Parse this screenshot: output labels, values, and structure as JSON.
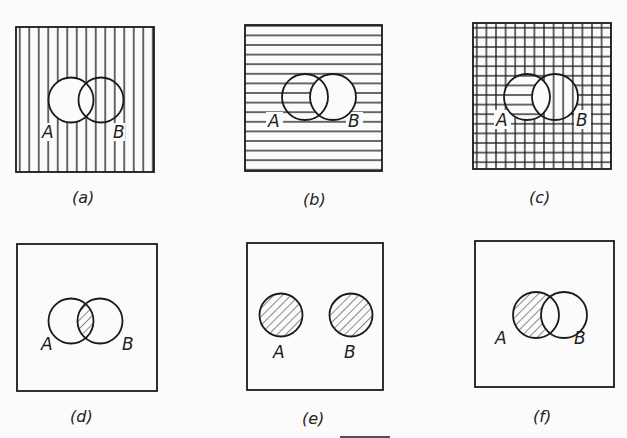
{
  "figure": {
    "stroke_color": "#1a1a1a",
    "background": "#fbfbfb",
    "panels": [
      {
        "id": "a",
        "caption": "(a)",
        "shading": "vertical lines over universe except interior of A",
        "set_labels": {
          "a": "A",
          "b": "B"
        }
      },
      {
        "id": "b",
        "caption": "(b)",
        "shading": "horizontal lines over universe except interior of B",
        "set_labels": {
          "a": "A",
          "b": "B"
        }
      },
      {
        "id": "c",
        "caption": "(c)",
        "shading": "grid (a and b overlaid); A-only horizontal, B-only vertical, A∩B blank",
        "set_labels": {
          "a": "A",
          "b": "B"
        }
      },
      {
        "id": "d",
        "caption": "(d)",
        "shading": "diagonal hatch on A∩B",
        "set_labels": {
          "a": "A",
          "b": "B"
        }
      },
      {
        "id": "e",
        "caption": "(e)",
        "shading": "diagonal hatch on disjoint A and B",
        "set_labels": {
          "a": "A",
          "b": "B"
        }
      },
      {
        "id": "f",
        "caption": "(f)",
        "shading": "diagonal hatch on A minus B",
        "set_labels": {
          "a": "A",
          "b": "B"
        }
      }
    ]
  }
}
